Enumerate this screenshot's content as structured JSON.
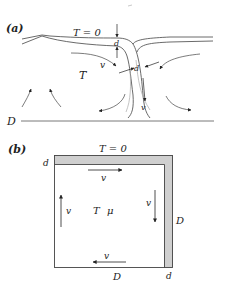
{
  "figure": {
    "panel_a": {
      "label": "(a)",
      "surface_label": "T = 0",
      "interior_label": "T",
      "velocity_label": "v",
      "downwelling_velocity_label": "v",
      "thickness_label_top": "d",
      "thickness_label_plume": "d",
      "depth_label": "D"
    },
    "panel_b": {
      "label": "(b)",
      "surface_label": "T = 0",
      "top_velocity_label": "v",
      "left_velocity_label": "v",
      "right_velocity_label": "v",
      "bottom_velocity_label": "v",
      "interior_label_T": "T",
      "interior_label_mu": "μ",
      "boundary_thickness_top": "d",
      "boundary_thickness_bottom": "d",
      "depth_label_right": "D",
      "width_label_bottom": "D"
    },
    "colors": {
      "line": "#333333",
      "light_line": "#999999",
      "boundary_layer_fill": "#cfcfcf"
    }
  }
}
